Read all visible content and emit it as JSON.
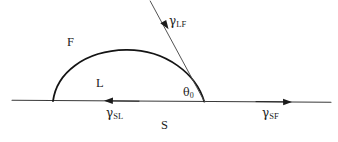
{
  "figure": {
    "stroke_color": "#1b1b1b",
    "droplet_color": "#141414",
    "baseline_color": "#3a3a3a",
    "tangent_color": "#4a4a4a",
    "background": "#ffffff"
  },
  "phase_labels": [
    {
      "name": "fluid-phase-label",
      "text": "F",
      "x": 67,
      "y": 36
    },
    {
      "name": "liquid-phase-label",
      "text": "L",
      "x": 96,
      "y": 77
    },
    {
      "name": "solid-phase-label",
      "text": "S",
      "x": 161,
      "y": 119
    }
  ],
  "tension_labels": [
    {
      "name": "gamma-lf-label",
      "symbol": "γ",
      "subscript": "LF",
      "full_text": "γLF",
      "x": 169,
      "y": 16
    },
    {
      "name": "gamma-sl-label",
      "symbol": "γ",
      "subscript": "SL",
      "full_text": "γSL",
      "x": 106,
      "y": 108
    },
    {
      "name": "gamma-sf-label",
      "symbol": "γ",
      "subscript": "SF",
      "full_text": "γSF",
      "x": 262,
      "y": 108
    }
  ],
  "angle_label": {
    "name": "contact-angle-label",
    "symbol": "θ",
    "subscript": "0",
    "full_text": "θ0",
    "x": 183,
    "y": 88
  },
  "geometry": {
    "baseline": {
      "x1": 12,
      "y1": 100,
      "x2": 331,
      "y2": 102
    },
    "droplet": {
      "left_contact": {
        "x": 53,
        "y": 101
      },
      "apex": {
        "x": 126,
        "y": 50
      },
      "right_contact": {
        "x": 204,
        "y": 101
      }
    },
    "tangent_line": {
      "x1": 150,
      "y1": 1,
      "x2": 205,
      "y2": 102
    },
    "arrows": [
      {
        "name": "gamma-lf-arrow",
        "direction": "down-left",
        "tip_x": 161,
        "tip_y": 25
      },
      {
        "name": "gamma-sl-arrow",
        "direction": "left",
        "tail_x": 139,
        "tail_y": 101,
        "tip_x": 104,
        "tip_y": 101
      },
      {
        "name": "gamma-sf-arrow",
        "direction": "right",
        "tail_x": 256,
        "tail_y": 102,
        "tip_x": 292,
        "tip_y": 102
      }
    ]
  }
}
